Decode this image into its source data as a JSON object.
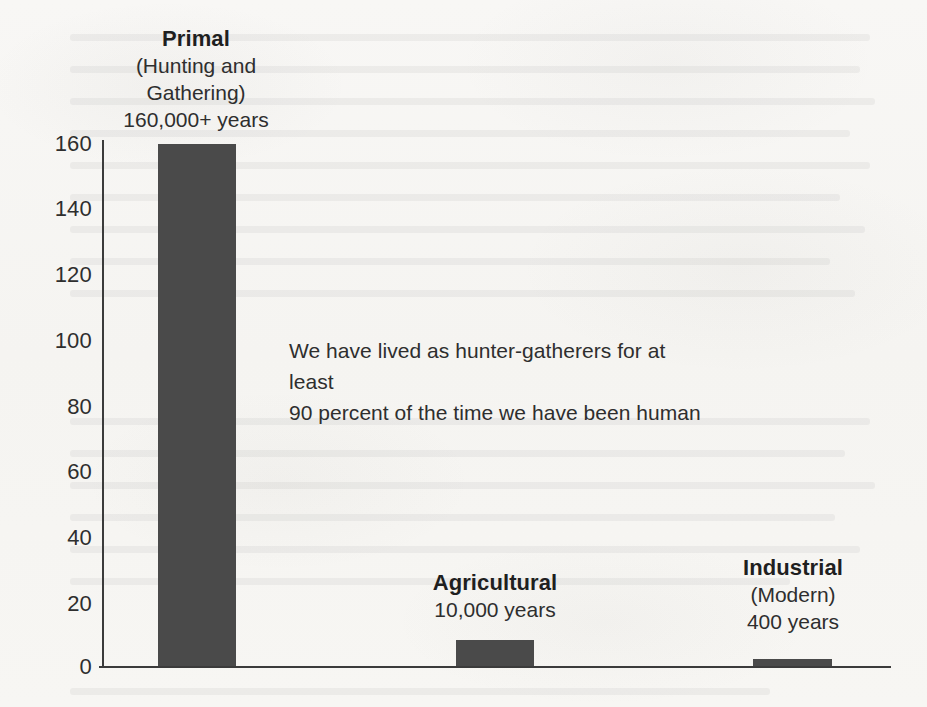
{
  "chart_data": {
    "type": "bar",
    "title": "",
    "subtitle": "",
    "xlabel": "",
    "ylabel": "",
    "categories": [
      "Primal (Hunting and Gathering)",
      "Agricultural",
      "Industrial (Modern)"
    ],
    "values": [
      160,
      8,
      2
    ],
    "value_labels": [
      "160,000+ years",
      "10,000 years",
      "400 years"
    ],
    "ylim": [
      0,
      170
    ],
    "y_ticks": [
      "0",
      "20",
      "40",
      "60",
      "80",
      "100",
      "120",
      "140",
      "160"
    ],
    "y_tick_values": [
      0,
      20,
      40,
      60,
      80,
      100,
      120,
      140,
      160
    ],
    "grid": false,
    "legend": "none",
    "bar_color": "#4a4a4a",
    "axis_color": "#3b3b3b",
    "background_color": "#f7f6f4",
    "units_note": "y-axis is in thousands of years",
    "annotation": {
      "line1": "We have lived as hunter-gatherers for at least",
      "line2": "90 percent of the time we have been human"
    }
  },
  "bars": [
    {
      "name": "Primal",
      "sub": "(Hunting and",
      "sub2": "Gathering)",
      "years": "160,000+ years",
      "value": 160
    },
    {
      "name": "Agricultural",
      "sub": "",
      "sub2": "",
      "years": "10,000 years",
      "value": 8
    },
    {
      "name": "Industrial",
      "sub": "(Modern)",
      "sub2": "",
      "years": "400 years",
      "value": 2
    }
  ],
  "y_axis": {
    "t160": "160",
    "t140": "140",
    "t120": "120",
    "t100": "100",
    "t80": "80",
    "t60": "60",
    "t40": "40",
    "t20": "20",
    "t0": "0"
  },
  "annotation": {
    "line1": "We have lived as hunter-gatherers for at least",
    "line2": "90 percent of the time we have been human"
  }
}
